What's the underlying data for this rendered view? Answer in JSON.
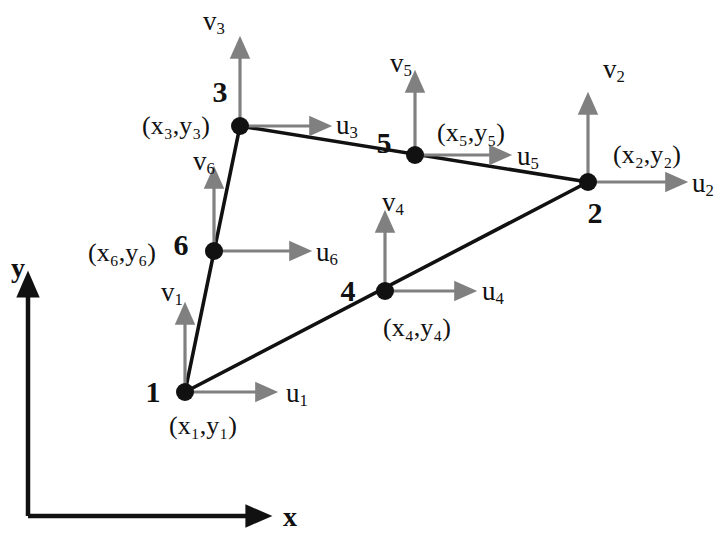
{
  "figure": {
    "type": "diagram",
    "background_color": "#ffffff",
    "element_line_color": "#111111",
    "vector_arrow_color": "#808080",
    "node_marker_color": "#111111",
    "axis_color": "#111111"
  },
  "axes": {
    "x_label": "x",
    "y_label": "y",
    "origin": {
      "x": 28,
      "y": 516
    },
    "x_tip": {
      "x": 255,
      "y": 516
    },
    "y_tip": {
      "x": 28,
      "y": 288
    },
    "x_label_pos": {
      "x": 290,
      "y": 517
    },
    "y_label_pos": {
      "x": 18,
      "y": 268
    }
  },
  "nodes": [
    {
      "id": "1",
      "number_label": "1",
      "coord_label": "(x₁,y₁)",
      "coord_base": "x",
      "coord_sub": "1",
      "u_label": "u",
      "u_sub": "1",
      "v_label": "v",
      "v_sub": "1",
      "pos": {
        "x": 185,
        "y": 392
      },
      "number_pos": {
        "x": 153,
        "y": 392
      },
      "coord_pos": {
        "x": 203,
        "y": 426
      },
      "u_tip": {
        "x": 266,
        "y": 392
      },
      "u_label_pos": {
        "x": 297,
        "y": 395
      },
      "v_tip": {
        "x": 185,
        "y": 314
      },
      "v_label_pos": {
        "x": 172,
        "y": 294
      }
    },
    {
      "id": "2",
      "number_label": "2",
      "coord_label": "(x₂,y₂)",
      "coord_base": "x",
      "coord_sub": "2",
      "u_label": "u",
      "u_sub": "2",
      "v_label": "v",
      "v_sub": "2",
      "pos": {
        "x": 588,
        "y": 182
      },
      "number_pos": {
        "x": 595,
        "y": 213
      },
      "coord_pos": {
        "x": 647,
        "y": 155
      },
      "u_tip": {
        "x": 676,
        "y": 182
      },
      "u_label_pos": {
        "x": 703,
        "y": 185
      },
      "v_tip": {
        "x": 588,
        "y": 104
      },
      "v_label_pos": {
        "x": 614,
        "y": 71
      }
    },
    {
      "id": "3",
      "number_label": "3",
      "coord_label": "(x₃,y₃)",
      "coord_base": "x",
      "coord_sub": "3",
      "u_label": "u",
      "u_sub": "3",
      "v_label": "v",
      "v_sub": "3",
      "pos": {
        "x": 240,
        "y": 126
      },
      "number_pos": {
        "x": 220,
        "y": 92
      },
      "coord_pos": {
        "x": 176,
        "y": 126
      },
      "u_tip": {
        "x": 320,
        "y": 126
      },
      "u_label_pos": {
        "x": 347,
        "y": 127
      },
      "v_tip": {
        "x": 240,
        "y": 48
      },
      "v_label_pos": {
        "x": 214,
        "y": 23
      }
    },
    {
      "id": "4",
      "number_label": "4",
      "coord_label": "(x₄,y₄)",
      "coord_base": "x",
      "coord_sub": "4",
      "u_label": "u",
      "u_sub": "4",
      "v_label": "v",
      "v_sub": "4",
      "pos": {
        "x": 385,
        "y": 291
      },
      "number_pos": {
        "x": 348,
        "y": 291
      },
      "coord_pos": {
        "x": 417,
        "y": 328
      },
      "u_tip": {
        "x": 465,
        "y": 291
      },
      "u_label_pos": {
        "x": 493,
        "y": 293
      },
      "v_tip": {
        "x": 385,
        "y": 222
      },
      "v_label_pos": {
        "x": 393,
        "y": 204
      }
    },
    {
      "id": "5",
      "number_label": "5",
      "coord_label": "(x₅,y₅)",
      "coord_base": "x",
      "coord_sub": "5",
      "u_label": "u",
      "u_sub": "5",
      "v_label": "v",
      "v_sub": "5",
      "pos": {
        "x": 415,
        "y": 155
      },
      "number_pos": {
        "x": 384,
        "y": 143
      },
      "coord_pos": {
        "x": 471,
        "y": 133
      },
      "u_tip": {
        "x": 500,
        "y": 155
      },
      "u_label_pos": {
        "x": 528,
        "y": 158
      },
      "v_tip": {
        "x": 415,
        "y": 82
      },
      "v_label_pos": {
        "x": 401,
        "y": 65
      }
    },
    {
      "id": "6",
      "number_label": "6",
      "coord_label": "(x₆,y₆)",
      "coord_base": "x",
      "coord_sub": "6",
      "u_label": "u",
      "u_sub": "6",
      "v_label": "v",
      "v_sub": "6",
      "pos": {
        "x": 214,
        "y": 251
      },
      "number_pos": {
        "x": 181,
        "y": 245
      },
      "coord_pos": {
        "x": 122,
        "y": 253
      },
      "u_tip": {
        "x": 300,
        "y": 251
      },
      "u_label_pos": {
        "x": 327,
        "y": 254
      },
      "v_tip": {
        "x": 214,
        "y": 178
      },
      "v_label_pos": {
        "x": 204,
        "y": 163
      }
    }
  ],
  "element_edges": [
    {
      "name": "edge-1-3",
      "from": "1",
      "to": "3"
    },
    {
      "name": "edge-3-2",
      "from": "3",
      "to": "2"
    },
    {
      "name": "edge-2-1",
      "from": "2",
      "to": "1"
    }
  ]
}
